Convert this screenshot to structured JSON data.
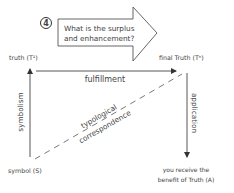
{
  "step_badge": "4",
  "question_arrow": {
    "line1": "What is the surplus",
    "line2": "and enhancement?"
  },
  "nodes": {
    "truth": "truth (T¹)",
    "final_truth": "final Truth (Tⁿ)",
    "symbol": "symbol (S)",
    "benefit_line1": "you receive the",
    "benefit_line2": "benefit of Truth (A)"
  },
  "edges": {
    "fulfillment": "fulfillment",
    "symbolism": "symbolism",
    "application": "application",
    "typological_line1": "typological",
    "typological_line2": "correspondence"
  },
  "colors": {
    "stroke": "#555555",
    "text": "#444444"
  }
}
